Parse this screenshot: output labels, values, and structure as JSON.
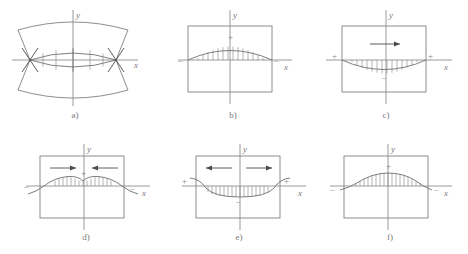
{
  "figure": {
    "background_color": "#ffffff",
    "line_color": "#808080",
    "hatch_color": "#8c8c8c",
    "text_color": "#7a7a7a",
    "panel_count": 6
  },
  "panels": [
    {
      "id": "a",
      "label": "a)",
      "kind": "lens-with-arch-boundaries",
      "axis_x_label": "x",
      "axis_y_label": "y",
      "has_frame": false,
      "signs": [],
      "arrows": []
    },
    {
      "id": "b",
      "label": "b)",
      "kind": "arch-positive",
      "axis_x_label": "x",
      "axis_y_label": "y",
      "has_frame": true,
      "signs": [
        {
          "text": "+",
          "position": "center-top"
        },
        {
          "text": "–",
          "position": "left"
        },
        {
          "text": "–",
          "position": "right"
        }
      ],
      "arrows": []
    },
    {
      "id": "c",
      "label": "c)",
      "kind": "sag-negative",
      "axis_x_label": "x",
      "axis_y_label": "y",
      "has_frame": true,
      "signs": [
        {
          "text": "+",
          "position": "left"
        },
        {
          "text": "+",
          "position": "right"
        },
        {
          "text": "–",
          "position": "center-bottom"
        }
      ],
      "arrows": [
        {
          "direction": "right",
          "position": "center"
        }
      ]
    },
    {
      "id": "d",
      "label": "d)",
      "kind": "double-hump",
      "axis_x_label": "x",
      "axis_y_label": "y",
      "has_frame": true,
      "signs": [
        {
          "text": "+",
          "position": "center-top"
        },
        {
          "text": "–",
          "position": "left"
        },
        {
          "text": "–",
          "position": "right"
        }
      ],
      "arrows": [
        {
          "direction": "right",
          "position": "left-of-center"
        },
        {
          "direction": "left",
          "position": "right-of-center"
        }
      ]
    },
    {
      "id": "e",
      "label": "e)",
      "kind": "sag-with-upturned-ends",
      "axis_x_label": "x",
      "axis_y_label": "y",
      "has_frame": true,
      "signs": [
        {
          "text": "+",
          "position": "left"
        },
        {
          "text": "+",
          "position": "right"
        },
        {
          "text": "–",
          "position": "center-bottom"
        }
      ],
      "arrows": [
        {
          "direction": "left",
          "position": "left-of-center"
        },
        {
          "direction": "right",
          "position": "right-of-center"
        }
      ]
    },
    {
      "id": "f",
      "label": "f)",
      "kind": "arch-positive-wide",
      "axis_x_label": "x",
      "axis_y_label": "y",
      "has_frame": true,
      "signs": [
        {
          "text": "+",
          "position": "center-top"
        },
        {
          "text": "–",
          "position": "left"
        },
        {
          "text": "–",
          "position": "right"
        }
      ],
      "arrows": []
    }
  ]
}
